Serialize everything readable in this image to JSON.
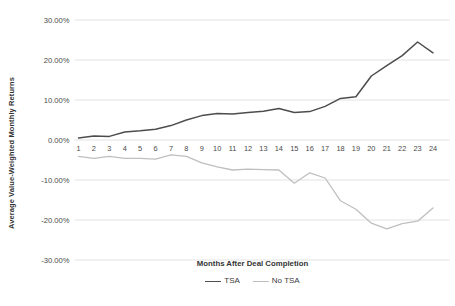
{
  "chart_data": {
    "type": "line",
    "title": "",
    "xlabel": "Months After Deal Completion",
    "ylabel": "Average Value-Weighted Monthly Returns",
    "x": [
      1,
      2,
      3,
      4,
      5,
      6,
      7,
      8,
      9,
      10,
      11,
      12,
      13,
      14,
      15,
      16,
      17,
      18,
      19,
      20,
      21,
      22,
      23,
      24
    ],
    "categories": [
      "1",
      "2",
      "3",
      "4",
      "5",
      "6",
      "7",
      "8",
      "9",
      "10",
      "11",
      "12",
      "13",
      "14",
      "15",
      "16",
      "17",
      "18",
      "19",
      "20",
      "21",
      "22",
      "23",
      "24"
    ],
    "xtick_labels": [
      "1",
      "2",
      "3",
      "4",
      "5",
      "6",
      "7",
      "8",
      "9",
      "10",
      "11",
      "12",
      "13",
      "14",
      "15",
      "16",
      "17",
      "18",
      "19",
      "20",
      "21",
      "22",
      "23",
      "24"
    ],
    "ytick_labels": [
      "30.00%",
      "20.00%",
      "10.00%",
      "0.00%",
      "-10.00%",
      "-20.00%",
      "-30.00%"
    ],
    "ytick_values": [
      30,
      20,
      10,
      0,
      -10,
      -20,
      -30
    ],
    "ylim": [
      -30,
      30
    ],
    "xlim": [
      1,
      24
    ],
    "grid": true,
    "legend_position": "bottom",
    "series": [
      {
        "name": "TSA",
        "color": "#4d4d4d",
        "values": [
          0.5,
          1.0,
          0.9,
          2.0,
          2.3,
          2.7,
          3.6,
          5.0,
          6.1,
          6.6,
          6.5,
          6.9,
          7.2,
          7.9,
          6.9,
          7.1,
          8.4,
          10.4,
          10.8,
          16.0,
          18.6,
          21.1,
          24.5,
          21.8
        ]
      },
      {
        "name": "No TSA",
        "color": "#bfbfbf",
        "values": [
          -4.1,
          -4.6,
          -4.1,
          -4.6,
          -4.6,
          -4.8,
          -3.7,
          -4.1,
          -5.7,
          -6.7,
          -7.5,
          -7.3,
          -7.4,
          -7.5,
          -10.8,
          -8.2,
          -9.5,
          -15.2,
          -17.3,
          -20.8,
          -22.2,
          -20.9,
          -20.3,
          -17.0
        ]
      }
    ]
  },
  "legend": {
    "entries": [
      {
        "label": "TSA"
      },
      {
        "label": "No TSA"
      }
    ]
  }
}
